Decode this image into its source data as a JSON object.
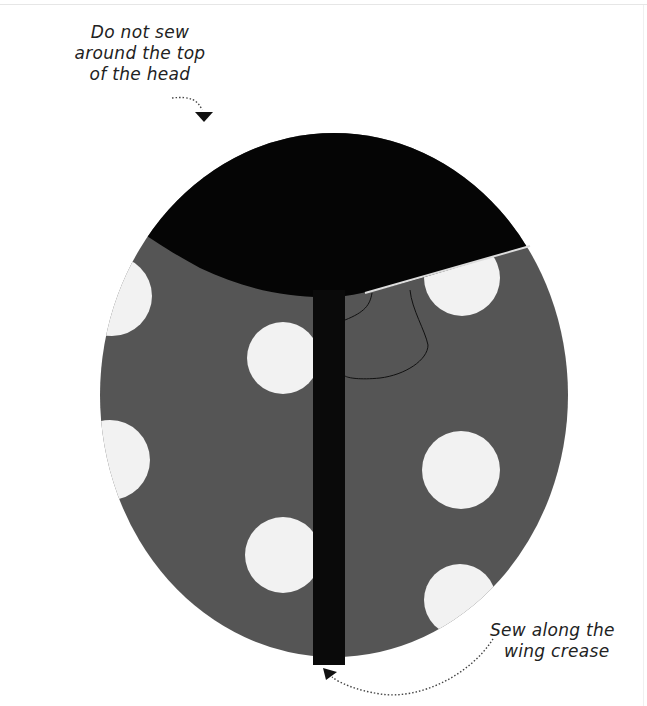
{
  "annotations": {
    "top": {
      "lines": [
        "Do not sew",
        "around the top",
        "of the head"
      ],
      "arrow": "dotted-arrow-down"
    },
    "bottom": {
      "lines": [
        "Sew along the",
        "wing crease"
      ],
      "arrow": "dotted-arrow-up-left"
    }
  },
  "illustration": {
    "subject": "ladybug fabric pieces pinned together",
    "colors": {
      "fabric": "#555555",
      "head": "#050505",
      "dots": "#f2f2f2",
      "strip": "#0a0a0a"
    }
  }
}
